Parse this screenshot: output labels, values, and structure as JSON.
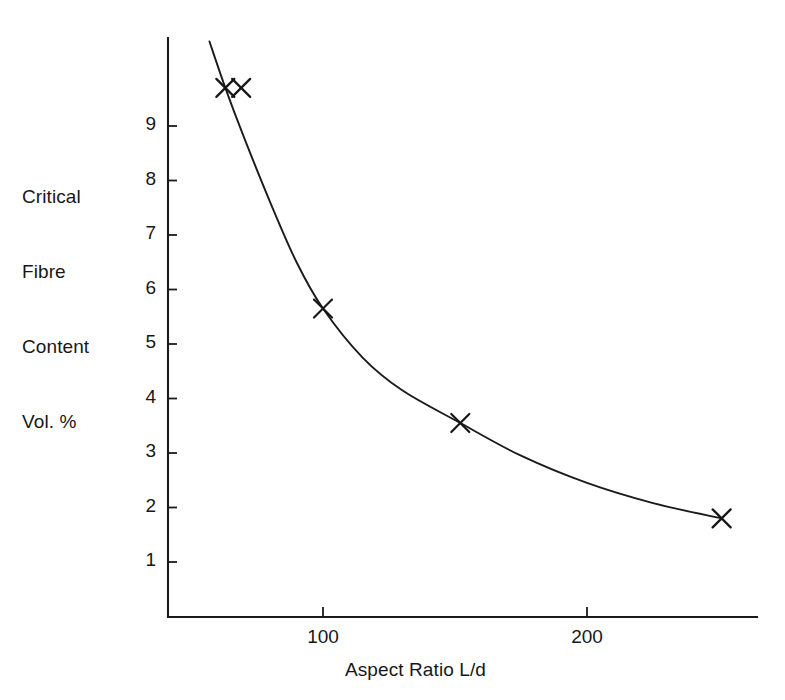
{
  "chart_data": {
    "type": "line",
    "title": "",
    "xlabel": "Aspect Ratio L/d",
    "ylabel": "Critical Fibre Content Vol. %",
    "ylabel_lines": [
      "Critical",
      "Fibre",
      "Content",
      "Vol. %"
    ],
    "xlim": [
      41,
      273
    ],
    "ylim": [
      0,
      10.55
    ],
    "grid": false,
    "legend": null,
    "xticks": [
      100,
      200
    ],
    "xtick_labels": [
      "100",
      "200"
    ],
    "yticks": [
      1,
      2,
      3,
      4,
      5,
      6,
      7,
      8,
      9
    ],
    "ytick_labels": [
      "1",
      "2",
      "3",
      "4",
      "5",
      "6",
      "7",
      "8",
      "9"
    ],
    "series": [
      {
        "name": "Critical fibre content vs aspect ratio",
        "marker": "x",
        "line": "fitted curve",
        "color": "#1b1b1b",
        "points": [
          {
            "x": 63,
            "y": 9.7
          },
          {
            "x": 69,
            "y": 9.7
          },
          {
            "x": 100,
            "y": 5.65
          },
          {
            "x": 152,
            "y": 3.55
          },
          {
            "x": 251,
            "y": 1.8
          }
        ],
        "curve": [
          {
            "x": 57,
            "y": 10.55
          },
          {
            "x": 63,
            "y": 9.7
          },
          {
            "x": 70,
            "y": 8.8
          },
          {
            "x": 80,
            "y": 7.6
          },
          {
            "x": 90,
            "y": 6.5
          },
          {
            "x": 100,
            "y": 5.65
          },
          {
            "x": 115,
            "y": 4.75
          },
          {
            "x": 130,
            "y": 4.15
          },
          {
            "x": 152,
            "y": 3.55
          },
          {
            "x": 175,
            "y": 2.95
          },
          {
            "x": 200,
            "y": 2.45
          },
          {
            "x": 225,
            "y": 2.08
          },
          {
            "x": 251,
            "y": 1.8
          }
        ]
      }
    ]
  },
  "geometry": {
    "x_axis_y": 617,
    "y_axis_x": 168,
    "x_at_100": 323,
    "x_at_200": 587,
    "y_at_1": 562,
    "y_at_9": 126,
    "x_axis_right": 757,
    "y_axis_top": 38
  }
}
